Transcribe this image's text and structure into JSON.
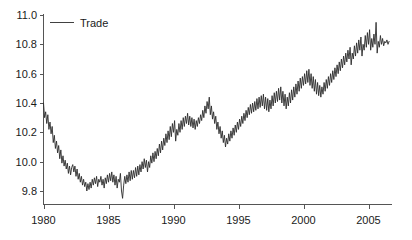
{
  "chart_data": {
    "type": "line",
    "title": "",
    "subtitle": "",
    "xlabel": "",
    "ylabel": "",
    "xlim": [
      1979.9,
      2006.6
    ],
    "ylim": [
      9.7,
      11.05
    ],
    "grid": false,
    "legend_position": "top-left",
    "legend": [
      "Trade"
    ],
    "xticks": [
      1980,
      1985,
      1990,
      1995,
      2000,
      2005
    ],
    "xtick_labels": [
      "1980",
      "1985",
      "1990",
      "1995",
      "2000",
      "2005"
    ],
    "yticks": [
      9.8,
      10.0,
      10.2,
      10.4,
      10.6,
      10.8,
      11.0
    ],
    "ytick_labels": [
      "9.8",
      "10.0",
      "10.2",
      "10.4",
      "10.6",
      "10.8",
      "11.0"
    ],
    "series": [
      {
        "name": "Trade",
        "color": "#2b2b2b",
        "x_start": 1980.0,
        "x_step": 0.0833333,
        "values": [
          10.4,
          10.3,
          10.34,
          10.26,
          10.32,
          10.22,
          10.27,
          10.19,
          10.24,
          10.13,
          10.18,
          10.09,
          10.14,
          10.06,
          10.11,
          10.02,
          10.08,
          9.99,
          10.04,
          9.97,
          10.01,
          9.95,
          9.99,
          9.92,
          9.97,
          9.91,
          9.96,
          9.98,
          9.93,
          9.97,
          9.9,
          9.95,
          9.88,
          9.92,
          9.86,
          9.9,
          9.84,
          9.88,
          9.83,
          9.86,
          9.8,
          9.85,
          9.81,
          9.86,
          9.82,
          9.88,
          9.84,
          9.89,
          9.85,
          9.9,
          9.83,
          9.88,
          9.86,
          9.9,
          9.84,
          9.88,
          9.82,
          9.89,
          9.85,
          9.91,
          9.86,
          9.92,
          9.87,
          9.93,
          9.86,
          9.91,
          9.84,
          9.9,
          9.82,
          9.88,
          9.86,
          9.92,
          9.8,
          9.75,
          9.84,
          9.9,
          9.85,
          9.91,
          9.86,
          9.93,
          9.87,
          9.94,
          9.88,
          9.94,
          9.89,
          9.96,
          9.9,
          9.97,
          9.91,
          9.98,
          9.93,
          10.0,
          9.95,
          10.02,
          9.96,
          10.01,
          9.93,
          10.0,
          9.96,
          10.04,
          9.99,
          10.06,
          10.0,
          10.07,
          10.02,
          10.09,
          10.04,
          10.12,
          10.06,
          10.14,
          10.08,
          10.16,
          10.11,
          10.19,
          10.13,
          10.21,
          10.15,
          10.24,
          10.17,
          10.26,
          10.2,
          10.28,
          10.14,
          10.22,
          10.18,
          10.26,
          10.2,
          10.28,
          10.22,
          10.3,
          10.24,
          10.31,
          10.26,
          10.33,
          10.25,
          10.31,
          10.24,
          10.3,
          10.23,
          10.29,
          10.22,
          10.28,
          10.24,
          10.3,
          10.26,
          10.32,
          10.28,
          10.35,
          10.3,
          10.38,
          10.33,
          10.41,
          10.36,
          10.44,
          10.32,
          10.38,
          10.29,
          10.34,
          10.26,
          10.31,
          10.22,
          10.27,
          10.19,
          10.24,
          10.16,
          10.21,
          10.13,
          10.18,
          10.1,
          10.16,
          10.12,
          10.19,
          10.14,
          10.21,
          10.16,
          10.23,
          10.18,
          10.25,
          10.2,
          10.27,
          10.22,
          10.29,
          10.24,
          10.31,
          10.26,
          10.33,
          10.28,
          10.35,
          10.3,
          10.37,
          10.32,
          10.39,
          10.33,
          10.4,
          10.34,
          10.41,
          10.35,
          10.43,
          10.36,
          10.44,
          10.37,
          10.45,
          10.38,
          10.46,
          10.36,
          10.44,
          10.35,
          10.43,
          10.34,
          10.42,
          10.36,
          10.45,
          10.38,
          10.47,
          10.4,
          10.48,
          10.41,
          10.5,
          10.42,
          10.51,
          10.4,
          10.48,
          10.38,
          10.46,
          10.36,
          10.44,
          10.38,
          10.47,
          10.4,
          10.49,
          10.42,
          10.51,
          10.44,
          10.53,
          10.46,
          10.55,
          10.48,
          10.57,
          10.5,
          10.58,
          10.52,
          10.6,
          10.53,
          10.62,
          10.54,
          10.63,
          10.52,
          10.6,
          10.5,
          10.58,
          10.48,
          10.56,
          10.46,
          10.54,
          10.45,
          10.52,
          10.44,
          10.51,
          10.46,
          10.54,
          10.48,
          10.56,
          10.5,
          10.58,
          10.52,
          10.6,
          10.54,
          10.62,
          10.56,
          10.64,
          10.58,
          10.66,
          10.6,
          10.68,
          10.62,
          10.7,
          10.64,
          10.72,
          10.66,
          10.74,
          10.68,
          10.76,
          10.7,
          10.78,
          10.66,
          10.74,
          10.7,
          10.79,
          10.72,
          10.81,
          10.74,
          10.83,
          10.76,
          10.85,
          10.72,
          10.8,
          10.76,
          10.86,
          10.78,
          10.88,
          10.8,
          10.9,
          10.76,
          10.84,
          10.78,
          10.87,
          10.8,
          10.95,
          10.74,
          10.82,
          10.78,
          10.86,
          10.8,
          10.84,
          10.79,
          10.82,
          10.81,
          10.83,
          10.8,
          10.82
        ]
      }
    ]
  },
  "legend": {
    "entries": [
      {
        "label": "Trade",
        "color": "#2b2b2b"
      }
    ]
  },
  "axes": {
    "y_tick_labels": [
      "11.0",
      "10.8",
      "10.6",
      "10.4",
      "10.2",
      "10.0",
      "9.8"
    ],
    "x_tick_labels": [
      "1980",
      "1985",
      "1990",
      "1995",
      "2000",
      "2005"
    ]
  }
}
